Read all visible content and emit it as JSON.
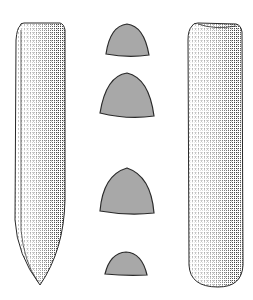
{
  "figure": {
    "colors": {
      "background": "#ffffff",
      "outline": "#2a2a2a",
      "hatch": "#3a3a3a",
      "section_fill": "#a8a8a8"
    },
    "views": [
      {
        "name": "left-face-view",
        "shape": "tapered blade with pointed end"
      },
      {
        "name": "right-side-view",
        "shape": "straight body with rounded end"
      }
    ],
    "cross_sections": [
      {
        "index": 1,
        "shape": "dome"
      },
      {
        "index": 2,
        "shape": "pointed dome"
      },
      {
        "index": 3,
        "shape": "pointed dome"
      },
      {
        "index": 4,
        "shape": "low dome"
      }
    ]
  }
}
